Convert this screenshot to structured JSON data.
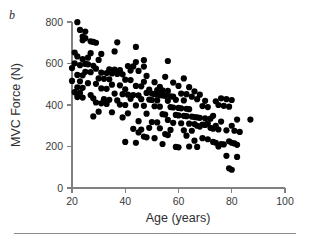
{
  "panel": {
    "label": "b"
  },
  "chart_data": {
    "type": "scatter",
    "title": "",
    "xlabel": "Age (years)",
    "ylabel": "MVC Force (N)",
    "xlim": [
      20,
      100
    ],
    "ylim": [
      0,
      800
    ],
    "xticks": [
      20,
      40,
      60,
      80,
      100
    ],
    "yticks": [
      0,
      200,
      400,
      600,
      800
    ],
    "grid": false,
    "legend": null,
    "marker": {
      "shape": "circle",
      "color": "#000000",
      "size": 3.1
    },
    "series": [
      {
        "name": "MVC Force vs Age",
        "points": [
          [
            22,
            799
          ],
          [
            23,
            762
          ],
          [
            25,
            754
          ],
          [
            24,
            730
          ],
          [
            25,
            722
          ],
          [
            24,
            712
          ],
          [
            27,
            707
          ],
          [
            28,
            704
          ],
          [
            29,
            700
          ],
          [
            37,
            702
          ],
          [
            44,
            680
          ],
          [
            36,
            658
          ],
          [
            21,
            653
          ],
          [
            27,
            650
          ],
          [
            31,
            646
          ],
          [
            22,
            634
          ],
          [
            26,
            628
          ],
          [
            24,
            621
          ],
          [
            30,
            617
          ],
          [
            47,
            616
          ],
          [
            44,
            607
          ],
          [
            56,
            612
          ],
          [
            21,
            601
          ],
          [
            25,
            598
          ],
          [
            26,
            596
          ],
          [
            23,
            592
          ],
          [
            28,
            589
          ],
          [
            41,
            588
          ],
          [
            43,
            586
          ],
          [
            47,
            585
          ],
          [
            20,
            578
          ],
          [
            29,
            575
          ],
          [
            34,
            572
          ],
          [
            36,
            570
          ],
          [
            38,
            568
          ],
          [
            42,
            566
          ],
          [
            45,
            564
          ],
          [
            25,
            560
          ],
          [
            27,
            558
          ],
          [
            31,
            556
          ],
          [
            33,
            554
          ],
          [
            35,
            552
          ],
          [
            37,
            550
          ],
          [
            39,
            548
          ],
          [
            22,
            545
          ],
          [
            24,
            543
          ],
          [
            48,
            540
          ],
          [
            55,
            536
          ],
          [
            30,
            528
          ],
          [
            32,
            526
          ],
          [
            34,
            524
          ],
          [
            40,
            522
          ],
          [
            42,
            520
          ],
          [
            20,
            516
          ],
          [
            23,
            514
          ],
          [
            47,
            512
          ],
          [
            51,
            510
          ],
          [
            58,
            508
          ],
          [
            62,
            528
          ],
          [
            26,
            505
          ],
          [
            29,
            502
          ],
          [
            35,
            498
          ],
          [
            38,
            495
          ],
          [
            44,
            492
          ],
          [
            46,
            490
          ],
          [
            53,
            488
          ],
          [
            22,
            485
          ],
          [
            24,
            483
          ],
          [
            31,
            480
          ],
          [
            33,
            478
          ],
          [
            40,
            476
          ],
          [
            49,
            474
          ],
          [
            52,
            472
          ],
          [
            54,
            470
          ],
          [
            56,
            468
          ],
          [
            60,
            492
          ],
          [
            64,
            486
          ],
          [
            21,
            462
          ],
          [
            23,
            458
          ],
          [
            22,
            452
          ],
          [
            27,
            448
          ],
          [
            36,
            455
          ],
          [
            39,
            452
          ],
          [
            41,
            450
          ],
          [
            43,
            448
          ],
          [
            45,
            446
          ],
          [
            48,
            458
          ],
          [
            50,
            455
          ],
          [
            51,
            452
          ],
          [
            52,
            450
          ],
          [
            53,
            448
          ],
          [
            54,
            446
          ],
          [
            55,
            444
          ],
          [
            57,
            442
          ],
          [
            58,
            440
          ],
          [
            61,
            455
          ],
          [
            63,
            452
          ],
          [
            66,
            466
          ],
          [
            68,
            450
          ],
          [
            22,
            438
          ],
          [
            24,
            436
          ],
          [
            28,
            432
          ],
          [
            32,
            428
          ],
          [
            34,
            425
          ],
          [
            37,
            422
          ],
          [
            42,
            430
          ],
          [
            46,
            428
          ],
          [
            49,
            426
          ],
          [
            50,
            424
          ],
          [
            52,
            422
          ],
          [
            56,
            420
          ],
          [
            59,
            425
          ],
          [
            62,
            422
          ],
          [
            65,
            440
          ],
          [
            67,
            428
          ],
          [
            70,
            420
          ],
          [
            74,
            418
          ],
          [
            76,
            432
          ],
          [
            78,
            428
          ],
          [
            80,
            424
          ],
          [
            29,
            412
          ],
          [
            31,
            408
          ],
          [
            33,
            405
          ],
          [
            38,
            402
          ],
          [
            40,
            400
          ],
          [
            44,
            398
          ],
          [
            47,
            396
          ],
          [
            51,
            394
          ],
          [
            53,
            392
          ],
          [
            57,
            390
          ],
          [
            58,
            388
          ],
          [
            60,
            386
          ],
          [
            61,
            384
          ],
          [
            63,
            382
          ],
          [
            64,
            380
          ],
          [
            69,
            395
          ],
          [
            71,
            390
          ],
          [
            75,
            400
          ],
          [
            77,
            396
          ],
          [
            79,
            392
          ],
          [
            30,
            368
          ],
          [
            35,
            365
          ],
          [
            41,
            360
          ],
          [
            48,
            358
          ],
          [
            54,
            356
          ],
          [
            55,
            354
          ],
          [
            59,
            352
          ],
          [
            60,
            350
          ],
          [
            62,
            348
          ],
          [
            63,
            346
          ],
          [
            65,
            344
          ],
          [
            66,
            342
          ],
          [
            67,
            340
          ],
          [
            68,
            338
          ],
          [
            70,
            336
          ],
          [
            72,
            334
          ],
          [
            73,
            348
          ],
          [
            82,
            330
          ],
          [
            87,
            330
          ],
          [
            28,
            345
          ],
          [
            39,
            340
          ],
          [
            45,
            322
          ],
          [
            50,
            318
          ],
          [
            52,
            316
          ],
          [
            56,
            328
          ],
          [
            58,
            314
          ],
          [
            61,
            312
          ],
          [
            64,
            310
          ],
          [
            66,
            308
          ],
          [
            69,
            306
          ],
          [
            70,
            304
          ],
          [
            71,
            312
          ],
          [
            74,
            300
          ],
          [
            76,
            320
          ],
          [
            80,
            300
          ],
          [
            43,
            285
          ],
          [
            46,
            282
          ],
          [
            49,
            290
          ],
          [
            53,
            288
          ],
          [
            57,
            280
          ],
          [
            62,
            278
          ],
          [
            65,
            276
          ],
          [
            67,
            300
          ],
          [
            68,
            296
          ],
          [
            72,
            290
          ],
          [
            73,
            286
          ],
          [
            75,
            282
          ],
          [
            78,
            278
          ],
          [
            81,
            276
          ],
          [
            83,
            270
          ],
          [
            40,
            222
          ],
          [
            44,
            218
          ],
          [
            47,
            248
          ],
          [
            48,
            244
          ],
          [
            51,
            240
          ],
          [
            54,
            212
          ],
          [
            59,
            198
          ],
          [
            60,
            196
          ],
          [
            63,
            252
          ],
          [
            66,
            228
          ],
          [
            69,
            240
          ],
          [
            71,
            235
          ],
          [
            73,
            222
          ],
          [
            74,
            218
          ],
          [
            76,
            212
          ],
          [
            77,
            210
          ],
          [
            79,
            225
          ],
          [
            80,
            218
          ],
          [
            81,
            215
          ],
          [
            82,
            208
          ],
          [
            64,
            200
          ],
          [
            67,
            198
          ],
          [
            75,
            200
          ],
          [
            78,
            155
          ],
          [
            79,
            95
          ],
          [
            80,
            88
          ],
          [
            82,
            150
          ],
          [
            55,
            260
          ],
          [
            56,
            255
          ],
          [
            45,
            268
          ]
        ]
      }
    ]
  }
}
